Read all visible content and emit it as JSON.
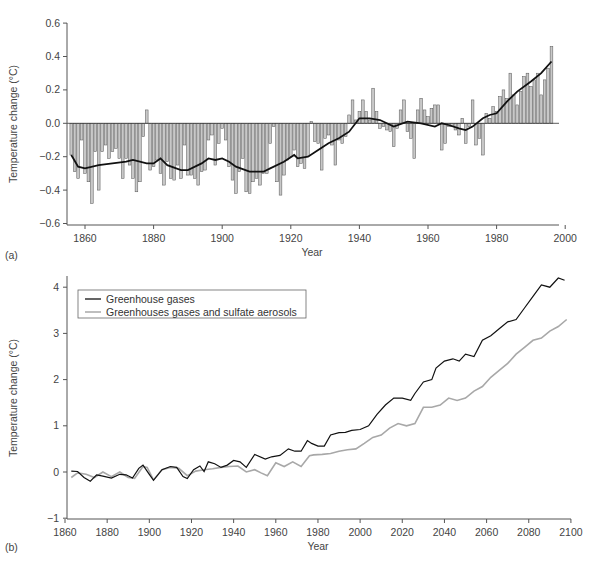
{
  "chart_data": [
    {
      "panel_label": "(a)",
      "type": "bar",
      "title": "",
      "xlabel": "Year",
      "ylabel": "Temperature change (°C)",
      "xlim": [
        1855,
        2000
      ],
      "ylim": [
        -0.6,
        0.6
      ],
      "xticks": [
        1860,
        1880,
        1900,
        1920,
        1940,
        1960,
        1980,
        2000
      ],
      "yticks": [
        "-0.6",
        "-0.4",
        "-0.2",
        "0.0",
        "0.2",
        "0.4",
        "0.6"
      ],
      "grid": false,
      "bar_color": "#c8c8c8",
      "line_color": "#111111",
      "series": [
        {
          "name": "Annual anomaly",
          "kind": "bar",
          "x": [
            1856,
            1857,
            1858,
            1859,
            1860,
            1861,
            1862,
            1863,
            1864,
            1865,
            1866,
            1867,
            1868,
            1869,
            1870,
            1871,
            1872,
            1873,
            1874,
            1875,
            1876,
            1877,
            1878,
            1879,
            1880,
            1881,
            1882,
            1883,
            1884,
            1885,
            1886,
            1887,
            1888,
            1889,
            1890,
            1891,
            1892,
            1893,
            1894,
            1895,
            1896,
            1897,
            1898,
            1899,
            1900,
            1901,
            1902,
            1903,
            1904,
            1905,
            1906,
            1907,
            1908,
            1909,
            1910,
            1911,
            1912,
            1913,
            1914,
            1915,
            1916,
            1917,
            1918,
            1919,
            1920,
            1921,
            1922,
            1923,
            1924,
            1925,
            1926,
            1927,
            1928,
            1929,
            1930,
            1931,
            1932,
            1933,
            1934,
            1935,
            1936,
            1937,
            1938,
            1939,
            1940,
            1941,
            1942,
            1943,
            1944,
            1945,
            1946,
            1947,
            1948,
            1949,
            1950,
            1951,
            1952,
            1953,
            1954,
            1955,
            1956,
            1957,
            1958,
            1959,
            1960,
            1961,
            1962,
            1963,
            1964,
            1965,
            1966,
            1967,
            1968,
            1969,
            1970,
            1971,
            1972,
            1973,
            1974,
            1975,
            1976,
            1977,
            1978,
            1979,
            1980,
            1981,
            1982,
            1983,
            1984,
            1985,
            1986,
            1987,
            1988,
            1989,
            1990,
            1991,
            1992,
            1993,
            1994,
            1995,
            1996
          ],
          "values": [
            -0.19,
            -0.29,
            -0.33,
            -0.1,
            -0.3,
            -0.35,
            -0.48,
            -0.17,
            -0.4,
            -0.17,
            -0.13,
            -0.21,
            -0.17,
            -0.15,
            -0.21,
            -0.33,
            -0.21,
            -0.25,
            -0.33,
            -0.41,
            -0.35,
            -0.08,
            0.08,
            -0.28,
            -0.26,
            -0.22,
            -0.3,
            -0.37,
            -0.23,
            -0.33,
            -0.34,
            -0.25,
            -0.33,
            -0.13,
            -0.31,
            -0.31,
            -0.33,
            -0.37,
            -0.29,
            -0.28,
            -0.1,
            -0.07,
            -0.25,
            -0.12,
            -0.03,
            -0.1,
            -0.26,
            -0.34,
            -0.42,
            -0.29,
            -0.21,
            -0.41,
            -0.42,
            -0.35,
            -0.33,
            -0.37,
            -0.3,
            -0.3,
            -0.12,
            -0.02,
            -0.35,
            -0.43,
            -0.31,
            -0.22,
            -0.2,
            -0.16,
            -0.26,
            -0.24,
            -0.27,
            -0.2,
            0.01,
            -0.11,
            -0.12,
            -0.28,
            -0.09,
            -0.07,
            -0.13,
            -0.25,
            -0.1,
            -0.12,
            -0.08,
            0.05,
            0.14,
            0.02,
            0.07,
            0.14,
            0.07,
            0.02,
            0.21,
            0.07,
            -0.03,
            -0.02,
            -0.04,
            -0.05,
            -0.14,
            -0.03,
            0.08,
            0.14,
            -0.05,
            -0.09,
            -0.21,
            0.08,
            0.15,
            0.08,
            0.04,
            0.09,
            0.11,
            0.11,
            -0.16,
            -0.12,
            -0.02,
            -0.02,
            -0.04,
            -0.07,
            0.03,
            -0.12,
            -0.02,
            0.14,
            -0.13,
            -0.09,
            -0.19,
            0.06,
            0.03,
            0.1,
            0.07,
            0.16,
            0.2,
            0.15,
            0.3,
            0.17,
            0.11,
            0.19,
            0.28,
            0.3,
            0.22,
            0.26,
            0.3,
            0.17,
            0.26,
            0.33,
            0.46
          ]
        },
        {
          "name": "Smoothed trend",
          "kind": "line",
          "x": [
            1856,
            1858,
            1860,
            1864,
            1868,
            1872,
            1874,
            1878,
            1880,
            1882,
            1884,
            1888,
            1890,
            1894,
            1896,
            1898,
            1900,
            1902,
            1904,
            1908,
            1912,
            1914,
            1918,
            1921,
            1922,
            1925,
            1928,
            1931,
            1934,
            1937,
            1940,
            1943,
            1946,
            1950,
            1954,
            1958,
            1962,
            1964,
            1966,
            1969,
            1971,
            1973,
            1976,
            1978,
            1980,
            1983,
            1986,
            1990,
            1993,
            1996
          ],
          "values": [
            -0.19,
            -0.26,
            -0.27,
            -0.25,
            -0.24,
            -0.23,
            -0.22,
            -0.24,
            -0.24,
            -0.21,
            -0.25,
            -0.28,
            -0.28,
            -0.24,
            -0.21,
            -0.22,
            -0.21,
            -0.23,
            -0.26,
            -0.29,
            -0.29,
            -0.27,
            -0.23,
            -0.19,
            -0.21,
            -0.2,
            -0.16,
            -0.12,
            -0.09,
            -0.05,
            0.03,
            0.03,
            0.02,
            -0.02,
            0.01,
            0.0,
            -0.02,
            0.0,
            -0.01,
            -0.03,
            -0.04,
            -0.02,
            0.03,
            0.05,
            0.06,
            0.13,
            0.19,
            0.25,
            0.3,
            0.37
          ]
        }
      ]
    },
    {
      "panel_label": "(b)",
      "type": "line",
      "title": "",
      "xlabel": "Year",
      "ylabel": "Temperature change (°C)",
      "xlim": [
        1860,
        2100
      ],
      "ylim": [
        -1,
        4.2
      ],
      "xticks": [
        1860,
        1880,
        1900,
        1920,
        1940,
        1960,
        1980,
        2000,
        2020,
        2040,
        2060,
        2080,
        2100
      ],
      "yticks": [
        "-1",
        "0",
        "1",
        "2",
        "3",
        "4"
      ],
      "grid": false,
      "legend_position": "upper left",
      "series": [
        {
          "name": "Greenhouse gases",
          "color": "#111111",
          "x": [
            1863,
            1866,
            1869,
            1872,
            1875,
            1878,
            1882,
            1886,
            1889,
            1892,
            1895,
            1897,
            1900,
            1902,
            1906,
            1910,
            1913,
            1916,
            1918,
            1921,
            1924,
            1926,
            1928,
            1931,
            1934,
            1937,
            1940,
            1943,
            1946,
            1950,
            1955,
            1958,
            1962,
            1966,
            1969,
            1972,
            1975,
            1977,
            1980,
            1983,
            1986,
            1990,
            1993,
            1996,
            2000,
            2004,
            2008,
            2012,
            2016,
            2020,
            2024,
            2026,
            2030,
            2034,
            2036,
            2040,
            2044,
            2047,
            2050,
            2054,
            2058,
            2062,
            2066,
            2070,
            2074,
            2078,
            2082,
            2086,
            2090,
            2094,
            2097
          ],
          "values": [
            0.02,
            0.01,
            -0.12,
            -0.2,
            -0.06,
            -0.09,
            -0.13,
            -0.05,
            -0.06,
            -0.13,
            0.08,
            0.15,
            -0.05,
            -0.18,
            0.05,
            0.12,
            0.1,
            -0.1,
            -0.14,
            0.05,
            0.13,
            0.01,
            0.22,
            0.18,
            0.1,
            0.15,
            0.25,
            0.22,
            0.1,
            0.38,
            0.28,
            0.33,
            0.36,
            0.5,
            0.45,
            0.45,
            0.68,
            0.62,
            0.56,
            0.56,
            0.8,
            0.85,
            0.86,
            0.9,
            0.92,
            1.0,
            1.25,
            1.45,
            1.6,
            1.6,
            1.55,
            1.7,
            1.95,
            2.0,
            2.25,
            2.4,
            2.45,
            2.4,
            2.55,
            2.5,
            2.85,
            2.95,
            3.1,
            3.25,
            3.3,
            3.55,
            3.8,
            4.05,
            4.0,
            4.2,
            4.15
          ]
        },
        {
          "name": "Greenhouses gases and sulfate aerosols",
          "color": "#a8a8a8",
          "x": [
            1863,
            1866,
            1870,
            1874,
            1878,
            1882,
            1886,
            1890,
            1893,
            1897,
            1899,
            1902,
            1906,
            1910,
            1914,
            1918,
            1922,
            1926,
            1930,
            1934,
            1938,
            1942,
            1946,
            1950,
            1953,
            1956,
            1960,
            1964,
            1968,
            1972,
            1976,
            1978,
            1982,
            1986,
            1990,
            1994,
            1998,
            2002,
            2006,
            2010,
            2014,
            2018,
            2022,
            2026,
            2030,
            2034,
            2038,
            2042,
            2046,
            2050,
            2054,
            2058,
            2062,
            2066,
            2070,
            2074,
            2078,
            2082,
            2086,
            2090,
            2094,
            2098
          ],
          "values": [
            -0.12,
            -0.02,
            -0.05,
            -0.12,
            0.0,
            -0.1,
            0.0,
            -0.12,
            -0.14,
            0.12,
            0.1,
            -0.17,
            0.05,
            0.1,
            0.08,
            -0.08,
            0.02,
            0.05,
            0.07,
            0.1,
            0.12,
            0.13,
            0.0,
            0.05,
            -0.02,
            -0.08,
            0.2,
            0.12,
            0.22,
            0.12,
            0.35,
            0.37,
            0.38,
            0.4,
            0.45,
            0.48,
            0.5,
            0.62,
            0.75,
            0.8,
            0.95,
            1.05,
            1.0,
            1.05,
            1.4,
            1.4,
            1.45,
            1.6,
            1.55,
            1.6,
            1.75,
            1.85,
            2.05,
            2.2,
            2.35,
            2.55,
            2.7,
            2.85,
            2.9,
            3.05,
            3.15,
            3.3
          ]
        }
      ]
    }
  ]
}
